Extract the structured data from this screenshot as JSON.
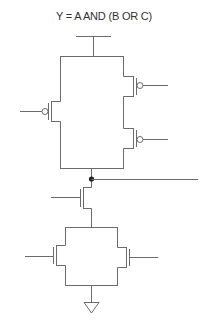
{
  "title": "Y = A AND (B OR C)",
  "diagram": {
    "type": "CMOS transistor-level schematic",
    "pull_up_network": {
      "transistors": [
        {
          "type": "PMOS",
          "position": "left",
          "gate_side": "left"
        },
        {
          "type": "PMOS",
          "position": "right-top",
          "gate_side": "right"
        },
        {
          "type": "PMOS",
          "position": "right-bottom",
          "gate_side": "right"
        }
      ],
      "supply": "VDD"
    },
    "output_node": {
      "label": "",
      "direction": "right"
    },
    "series_nmos": {
      "type": "NMOS",
      "gate_side": "left"
    },
    "pull_down_network": {
      "transistors": [
        {
          "type": "NMOS",
          "position": "left",
          "gate_side": "left"
        },
        {
          "type": "NMOS",
          "position": "right",
          "gate_side": "right"
        }
      ],
      "supply": "GND"
    },
    "colors": {
      "wire": "#6b6b6b",
      "node": "#222222"
    }
  }
}
